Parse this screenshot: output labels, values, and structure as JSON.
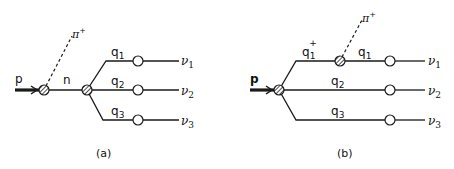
{
  "diagram_a": {
    "caption": "(a)",
    "incoming": "p",
    "pion": "π",
    "pion_charge": "+",
    "intermediate": "n",
    "branches": [
      {
        "q": "q",
        "q_sub": "1",
        "nu": "ν",
        "nu_sub": "1"
      },
      {
        "q": "q",
        "q_sub": "2",
        "nu": "ν",
        "nu_sub": "2"
      },
      {
        "q": "q",
        "q_sub": "3",
        "nu": "ν",
        "nu_sub": "3"
      }
    ]
  },
  "diagram_b": {
    "caption": "(b)",
    "incoming": "p",
    "pion": "π",
    "pion_charge": "+",
    "q1_plus": "q",
    "q1_plus_sub": "1",
    "q1_plus_sup": "+",
    "branches": [
      {
        "q": "q",
        "q_sub": "1",
        "nu": "ν",
        "nu_sub": "1"
      },
      {
        "q": "q",
        "q_sub": "2",
        "nu": "ν",
        "nu_sub": "2"
      },
      {
        "q": "q",
        "q_sub": "3",
        "nu": "ν",
        "nu_sub": "3"
      }
    ]
  },
  "colors": {
    "line": "#1a1a1a",
    "background": "#ffffff"
  }
}
